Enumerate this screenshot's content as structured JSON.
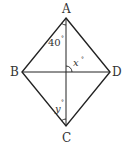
{
  "diagram": {
    "type": "rhombus-with-diagonals",
    "vertices": {
      "A": {
        "label": "A",
        "x": 66,
        "y": 18
      },
      "B": {
        "label": "B",
        "x": 22,
        "y": 72
      },
      "C": {
        "label": "C",
        "x": 66,
        "y": 126
      },
      "D": {
        "label": "D",
        "x": 110,
        "y": 72
      }
    },
    "angles": {
      "angle_A": {
        "value": "40",
        "degree": "°"
      },
      "angle_x": {
        "value": "x",
        "degree": "°"
      },
      "angle_y": {
        "value": "y",
        "degree": "°"
      }
    },
    "colors": {
      "line": "#222222",
      "text": "#333333"
    }
  }
}
